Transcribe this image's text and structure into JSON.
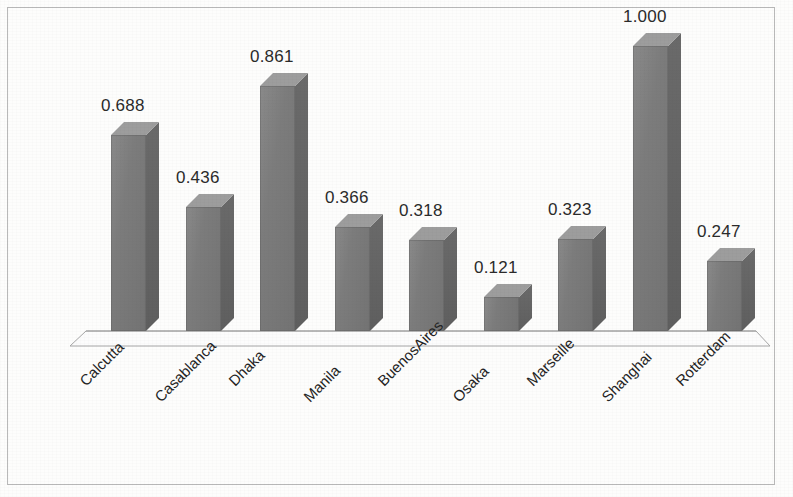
{
  "chart_data": {
    "type": "bar",
    "title": "",
    "subtitle": "",
    "xlabel": "",
    "ylabel": "",
    "ylim": [
      0,
      1.0
    ],
    "grid": false,
    "legend": "none",
    "style": "3d-column",
    "categories": [
      "Calcutta",
      "Casablanca",
      "Dhaka",
      "Manila",
      "BuenosAires",
      "Osaka",
      "Marseille",
      "Shanghai",
      "Rotterdam"
    ],
    "values": [
      0.688,
      0.436,
      0.861,
      0.366,
      0.318,
      0.121,
      0.323,
      1.0,
      0.247
    ],
    "value_labels": [
      "0.688",
      "0.436",
      "0.861",
      "0.366",
      "0.318",
      "0.121",
      "0.323",
      "1.000",
      "0.247"
    ],
    "series": [
      {
        "name": "",
        "values": [
          0.688,
          0.436,
          0.861,
          0.366,
          0.318,
          0.121,
          0.323,
          1.0,
          0.247
        ]
      }
    ]
  },
  "colors": {
    "bar_front": "#7c7c7c",
    "bar_top": "#9d9d9d",
    "bar_side": "#636363",
    "frame_border": "#b9b9b9",
    "floor_line": "#a6a6a6",
    "label_text": "#2b2b2b",
    "background": "#fdfdfc"
  },
  "axis": {
    "baseline_y": 330,
    "floor_front_y": 345,
    "pixels_per_unit": 285
  }
}
